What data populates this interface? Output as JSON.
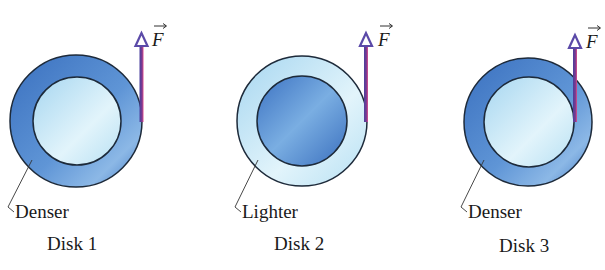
{
  "diagram": {
    "colors": {
      "dense_dark": "#3f78c4",
      "dense_light": "#7eaee0",
      "light_dark": "#a9d8f0",
      "light_light": "#e6f6fc",
      "outline": "#1d2a3a",
      "arrow_body": "#6b3a8f",
      "arrow_edge": "#d4468a",
      "arrow_head": "#5b4aa8"
    },
    "force_symbol": "F",
    "disks": [
      {
        "name": "Disk 1",
        "label": "Disk 1",
        "region_label": "Denser",
        "outer_region": "denser",
        "inner_region": "lighter",
        "force_label": "F"
      },
      {
        "name": "Disk 2",
        "label": "Disk 2",
        "region_label": "Lighter",
        "outer_region": "lighter",
        "inner_region": "denser",
        "force_label": "F"
      },
      {
        "name": "Disk 3",
        "label": "Disk 3",
        "region_label": "Denser",
        "outer_region": "denser",
        "inner_region": "lighter",
        "force_label": "F"
      }
    ]
  }
}
